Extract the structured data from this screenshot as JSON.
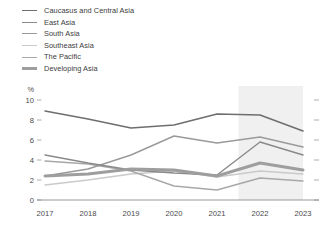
{
  "legend": {
    "position": "top-left",
    "items": [
      {
        "label": "Caucasus and Central Asia",
        "color": "#6e6e6e",
        "width": 1.5
      },
      {
        "label": "East Asia",
        "color": "#8a8a8a",
        "width": 1.4
      },
      {
        "label": "South Asia",
        "color": "#9a9a9a",
        "width": 1.4
      },
      {
        "label": "Southeast Asia",
        "color": "#cacaca",
        "width": 1.4
      },
      {
        "label": "The Pacific",
        "color": "#a8a8a8",
        "width": 1.4
      },
      {
        "label": "Developing Asia",
        "color": "#9e9e9e",
        "width": 3.0
      }
    ]
  },
  "axes": {
    "unit": "%",
    "y_ticks": [
      "10",
      "8",
      "6",
      "4",
      "2",
      "0"
    ],
    "x_ticks": [
      "2017",
      "2018",
      "2019",
      "2020",
      "2021",
      "2022",
      "2023"
    ],
    "ylim": [
      0,
      10
    ],
    "grid": false
  },
  "annotations": {
    "forecast_band_start": "2021.5",
    "forecast_band_end": "2023"
  },
  "chart_data": {
    "type": "line",
    "title": "",
    "subtitle": "",
    "xlabel": "",
    "ylabel": "%",
    "ylim": [
      0,
      10
    ],
    "grid": false,
    "legend_position": "top-left",
    "categories": [
      "2017",
      "2018",
      "2019",
      "2020",
      "2021",
      "2022",
      "2023"
    ],
    "series": [
      {
        "name": "Caucasus and Central Asia",
        "color": "#6e6e6e",
        "width": 1.5,
        "values": [
          8.9,
          8.1,
          7.2,
          7.5,
          8.6,
          8.5,
          6.9
        ]
      },
      {
        "name": "East Asia",
        "color": "#8a8a8a",
        "width": 1.4,
        "values": [
          4.5,
          3.7,
          3.0,
          2.7,
          2.5,
          5.8,
          4.5
        ]
      },
      {
        "name": "South Asia",
        "color": "#9a9a9a",
        "width": 1.4,
        "values": [
          2.4,
          3.1,
          4.5,
          6.4,
          5.7,
          6.3,
          5.3
        ]
      },
      {
        "name": "Southeast Asia",
        "color": "#cacaca",
        "width": 1.4,
        "values": [
          1.5,
          2.0,
          2.6,
          2.9,
          2.3,
          2.9,
          2.6
        ]
      },
      {
        "name": "The Pacific",
        "color": "#a8a8a8",
        "width": 1.4,
        "values": [
          3.9,
          3.6,
          2.9,
          1.4,
          1.0,
          2.2,
          1.9
        ]
      },
      {
        "name": "Developing Asia",
        "color": "#9e9e9e",
        "width": 3.0,
        "values": [
          2.4,
          2.6,
          3.1,
          3.0,
          2.4,
          3.7,
          3.0
        ]
      }
    ]
  }
}
